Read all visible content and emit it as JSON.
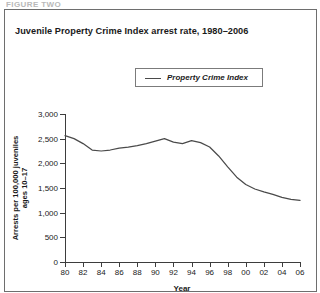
{
  "page": {
    "cut_off_header": "FIGURE TWO"
  },
  "chart": {
    "title": "Juvenile Property Crime Index arrest rate, 1980–2006",
    "legend": {
      "position": "top-center",
      "entries": [
        {
          "label": "Property Crime Index",
          "color": "#4a4a4a",
          "marker": "line"
        }
      ]
    },
    "line_color": "#4a4a4a"
  },
  "chart_data": {
    "type": "line",
    "title": "Juvenile Property Crime Index arrest rate, 1980–2006",
    "xlabel": "Year",
    "ylabel": "Arrests per 100,000 juveniles ages 10–17",
    "ylabel_line1": "Arrests per 100,000 juveniles",
    "ylabel_line2": "ages 10–17",
    "grid": false,
    "legend_position": "top-center",
    "xlim": [
      1980,
      2006
    ],
    "ylim": [
      0,
      3000
    ],
    "yticks": [
      0,
      500,
      1000,
      1500,
      2000,
      2500,
      3000
    ],
    "ytick_labels": [
      "0",
      "500",
      "1,000",
      "1,500",
      "2,000",
      "2,500",
      "3,000"
    ],
    "xticks": [
      1980,
      1982,
      1984,
      1986,
      1988,
      1990,
      1992,
      1994,
      1996,
      1998,
      2000,
      2002,
      2004,
      2006
    ],
    "xtick_labels": [
      "80",
      "82",
      "84",
      "86",
      "88",
      "90",
      "92",
      "94",
      "96",
      "98",
      "00",
      "02",
      "04",
      "06"
    ],
    "x": [
      1980,
      1981,
      1982,
      1983,
      1984,
      1985,
      1986,
      1987,
      1988,
      1989,
      1990,
      1991,
      1992,
      1993,
      1994,
      1995,
      1996,
      1997,
      1998,
      1999,
      2000,
      2001,
      2002,
      2003,
      2004,
      2005,
      2006
    ],
    "series": [
      {
        "name": "Property Crime Index",
        "color": "#4a4a4a",
        "values": [
          2560,
          2500,
          2400,
          2270,
          2250,
          2270,
          2310,
          2330,
          2360,
          2400,
          2450,
          2500,
          2430,
          2400,
          2460,
          2420,
          2330,
          2150,
          1930,
          1720,
          1570,
          1480,
          1420,
          1370,
          1310,
          1270,
          1250
        ]
      }
    ]
  }
}
